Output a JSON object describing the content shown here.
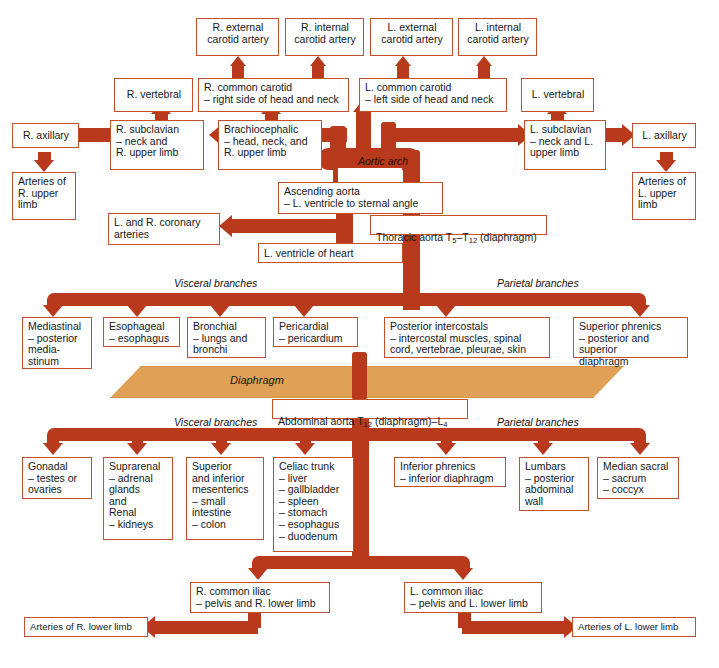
{
  "diagram": {
    "accent_color": "#b8391b",
    "box_border_color": "#c4502b",
    "diaphragm_color": "#e0a157"
  },
  "labels": {
    "aortic_arch": "Aortic arch",
    "diaphragm": "Diaphragm",
    "visceral_branches_thoracic": "Visceral branches",
    "parietal_branches_thoracic": "Parietal branches",
    "visceral_branches_abdominal": "Visceral branches",
    "parietal_branches_abdominal": "Parietal branches"
  },
  "boxes": {
    "r_external_carotid": "R. external\ncarotid artery",
    "r_internal_carotid": "R. internal\ncarotid artery",
    "l_external_carotid": "L. external\ncarotid artery",
    "l_internal_carotid": "L. internal\ncarotid artery",
    "r_vertebral": "R. vertebral",
    "l_vertebral": "L. vertebral",
    "r_common_carotid": "R. common carotid\n– right side of head and neck",
    "l_common_carotid": "L. common carotid\n– left side of head and neck",
    "r_axillary": "R. axillary",
    "l_axillary": "L. axillary",
    "r_subclavian": "R. subclavian\n– neck and\n   R. upper limb",
    "l_subclavian": "L. subclavian\n– neck and L.\n   upper limb",
    "brachiocephalic": "Brachiocephalic\n– head, neck, and\n   R. upper limb",
    "arteries_r_upper_limb": "Arteries of\nR. upper\nlimb",
    "arteries_l_upper_limb": "Arteries of\nL. upper\nlimb",
    "ascending_aorta": "Ascending aorta\n– L. ventricle to sternal angle",
    "coronary_arteries": "L. and R. coronary\narteries",
    "l_ventricle_of_heart": "L. ventricle of heart",
    "thoracic_aorta_pre": "Thoracic aorta T",
    "thoracic_aorta_sub1": "5",
    "thoracic_aorta_mid": "–T",
    "thoracic_aorta_sub2": "12",
    "thoracic_aorta_post": " (diaphragm)",
    "abdominal_aorta_pre": "Abdominal aorta T",
    "abdominal_aorta_sub1": "12",
    "abdominal_aorta_mid": " (diaphragm)–L",
    "abdominal_aorta_sub2": "4",
    "mediastinal": "Mediastinal\n– posterior\n   media-\n   stinum",
    "esophageal": "Esophageal\n– esophagus",
    "bronchial": "Bronchial\n– lungs and\n   bronchi",
    "pericardial": "Pericardial\n– pericardium",
    "posterior_intercostals": "Posterior intercostals\n– intercostal muscles, spinal\n   cord, vertebrae, pleurae, skin",
    "superior_phrenics": "Superior phrenics\n– posterior and superior\n   diaphragm",
    "gonadal": "Gonadal\n– testes or\n   ovaries",
    "suprarenal_renal": "Suprarenal\n– adrenal\n   glands\n   and\nRenal\n– kidneys",
    "superior_inferior_mesenterics": "Superior\nand inferior\nmesenterics\n– small\n   intestine\n– colon",
    "celiac_trunk": "Celiac trunk\n– liver\n– gallbladder\n– spleen\n– stomach\n– esophagus\n– duodenum",
    "inferior_phrenics": "Inferior phrenics\n– inferior diaphragm",
    "lumbars": "Lumbars\n– posterior\n   abdominal\n   wall",
    "median_sacral": "Median sacral\n– sacrum\n– coccyx",
    "r_common_iliac": "R. common iliac\n– pelvis and R. lower limb",
    "l_common_iliac": "L. common iliac\n– pelvis and L. lower limb",
    "arteries_r_lower_limb": "Arteries of R. lower limb",
    "arteries_l_lower_limb": "Arteries of L. lower limb"
  }
}
